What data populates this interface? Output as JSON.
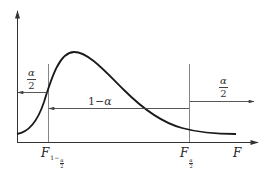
{
  "diagram": {
    "type": "F-distribution two-tailed critical region",
    "axes": {
      "x_label": "F",
      "y_axis": "density (unlabeled)"
    },
    "critical_values": {
      "lower": {
        "symbol": "F",
        "subscript_prefix": "1−",
        "subscript_num": "α",
        "subscript_den": "2"
      },
      "upper": {
        "symbol": "F",
        "subscript_num": "α",
        "subscript_den": "2"
      }
    },
    "regions": {
      "left_tail": {
        "numerator": "α",
        "denominator": "2",
        "direction": "left"
      },
      "middle": {
        "text_prefix": "1−",
        "text_symbol": "α",
        "direction": "left"
      },
      "right_tail": {
        "numerator": "α",
        "denominator": "2",
        "direction": "right"
      }
    },
    "colors": {
      "curve": "#1a1a1a",
      "axis": "#333333",
      "guide": "#666666",
      "background": "#ffffff"
    }
  }
}
